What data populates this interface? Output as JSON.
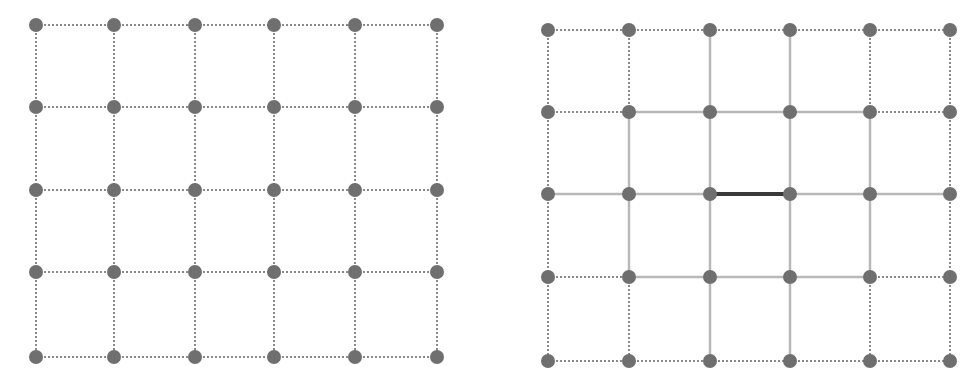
{
  "title_strip": "",
  "colors": {
    "node": "#6f6f6f",
    "dotted_edge": "#8a8a8a",
    "solid_edge": "#b8b8b8",
    "highlight_edge": "#3a3a3a",
    "background": "#ffffff"
  },
  "node_radius": 7,
  "grids": [
    {
      "name": "left-grid",
      "xs": [
        36,
        114,
        195,
        274,
        355,
        437
      ],
      "ys": [
        25,
        107,
        190,
        272,
        357
      ],
      "h_edges": [
        [
          "d",
          "d",
          "d",
          "d",
          "d"
        ],
        [
          "d",
          "d",
          "d",
          "d",
          "d"
        ],
        [
          "d",
          "d",
          "d",
          "d",
          "d"
        ],
        [
          "d",
          "d",
          "d",
          "d",
          "d"
        ],
        [
          "d",
          "d",
          "d",
          "d",
          "d"
        ]
      ],
      "v_edges": [
        [
          "d",
          "d",
          "d",
          "d"
        ],
        [
          "d",
          "d",
          "d",
          "d"
        ],
        [
          "d",
          "d",
          "d",
          "d"
        ],
        [
          "d",
          "d",
          "d",
          "d"
        ],
        [
          "d",
          "d",
          "d",
          "d"
        ],
        [
          "d",
          "d",
          "d",
          "d"
        ]
      ]
    },
    {
      "name": "right-grid",
      "xs": [
        548,
        629,
        710,
        790,
        870,
        950
      ],
      "ys": [
        30,
        112,
        194,
        277,
        361
      ],
      "h_edges": [
        [
          "d",
          "d",
          "d",
          "d",
          "d"
        ],
        [
          "d",
          "s",
          "s",
          "s",
          "d"
        ],
        [
          "s",
          "s",
          "h",
          "s",
          "s"
        ],
        [
          "d",
          "s",
          "s",
          "s",
          "d"
        ],
        [
          "d",
          "d",
          "d",
          "d",
          "d"
        ]
      ],
      "v_edges": [
        [
          "d",
          "d",
          "d",
          "d"
        ],
        [
          "d",
          "s",
          "s",
          "d"
        ],
        [
          "s",
          "s",
          "s",
          "s"
        ],
        [
          "s",
          "s",
          "s",
          "s"
        ],
        [
          "d",
          "s",
          "s",
          "d"
        ],
        [
          "d",
          "d",
          "d",
          "d"
        ]
      ]
    }
  ],
  "legend": {
    "d": "dotted edge",
    "s": "solid edge",
    "h": "highlighted edge"
  }
}
